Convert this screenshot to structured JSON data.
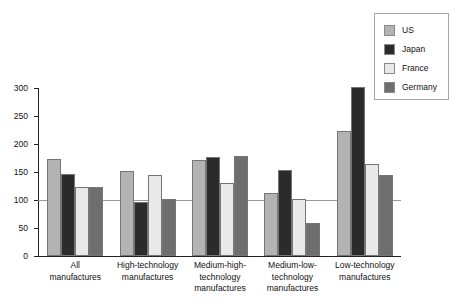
{
  "chart_data": {
    "type": "bar",
    "title": "",
    "subtitle": "",
    "xlabel": "",
    "ylabel": "",
    "ylim": [
      0,
      300
    ],
    "yticks": [
      0,
      50,
      100,
      150,
      200,
      250,
      300
    ],
    "grid": false,
    "reference_line": 100,
    "legend_position": "top-right",
    "categories": [
      "All manufactures",
      "High-technology manufactures",
      "Medium-high-technology manufactures",
      "Medium-low-technology manufactures",
      "Low-technology manufactures"
    ],
    "series": [
      {
        "name": "US",
        "color": "#b3b3b3",
        "values": [
          173,
          152,
          172,
          112,
          224
        ]
      },
      {
        "name": "Japan",
        "color": "#2b2b2b",
        "values": [
          147,
          97,
          177,
          154,
          301
        ]
      },
      {
        "name": "France",
        "color": "#e9e9e9",
        "values": [
          124,
          144,
          130,
          101,
          165
        ]
      },
      {
        "name": "Germany",
        "color": "#6e6e6e",
        "values": [
          124,
          101,
          179,
          59,
          145
        ]
      }
    ]
  },
  "legend": {
    "items": [
      {
        "label": "US",
        "color": "#b3b3b3"
      },
      {
        "label": "Japan",
        "color": "#2b2b2b"
      },
      {
        "label": "France",
        "color": "#e9e9e9"
      },
      {
        "label": "Germany",
        "color": "#6e6e6e"
      }
    ]
  },
  "axis": {
    "y_tick_labels": [
      "300",
      "250",
      "200",
      "150",
      "100",
      "50",
      "0"
    ]
  },
  "x_axis_labels": [
    "All\nmanufactures",
    "High-technology\nmanufactures",
    "Medium-high-\ntechnology\nmanufactures",
    "Medium-low-\ntechnology\nmanufactures",
    "Low-technology\nmanufactures"
  ]
}
